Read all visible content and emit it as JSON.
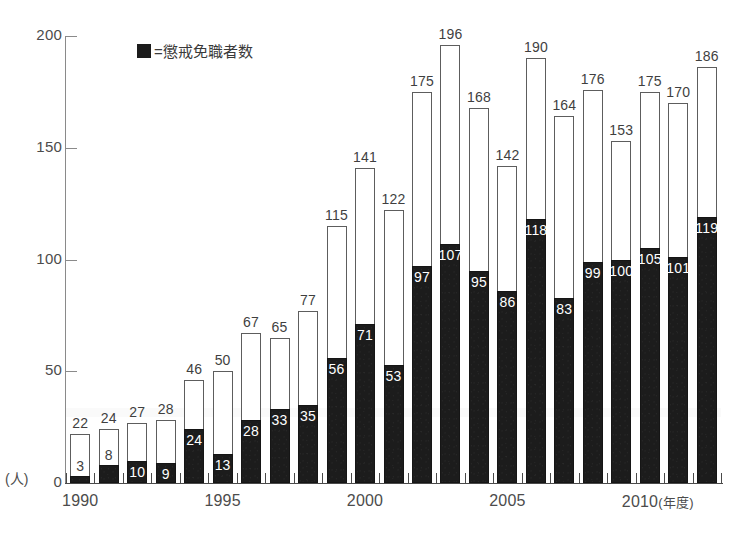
{
  "legend": {
    "swatch": "dark-square-icon",
    "text": "=懲戒免職者数",
    "swatch_color": "#1c1c1c"
  },
  "axes": {
    "y_unit": "(人)",
    "y_ticks": [
      "0",
      "50",
      "100",
      "150",
      "200"
    ],
    "x_unit": "(年度)",
    "x_ticks": [
      "1990",
      "1995",
      "2000",
      "2005",
      "2010"
    ]
  },
  "colors": {
    "total_bar_fill": "#ffffff",
    "total_bar_border": "#5d5d5d",
    "dark_bar_fill": "#1c1c1c",
    "text": "#3f3f3f",
    "axis": "#4a4a4a"
  },
  "chart_data": {
    "type": "bar",
    "title": "",
    "subtitle": "",
    "xlabel": "(年度)",
    "ylabel": "(人)",
    "ylim": [
      0,
      200
    ],
    "grid": false,
    "legend_position": "top-left",
    "stacked": true,
    "categories": [
      "1990",
      "1991",
      "1992",
      "1993",
      "1994",
      "1995",
      "1996",
      "1997",
      "1998",
      "1999",
      "2000",
      "2001",
      "2002",
      "2003",
      "2004",
      "2005",
      "2006",
      "2007",
      "2008",
      "2009",
      "2010",
      "2011",
      "2012"
    ],
    "series": [
      {
        "name": "総数",
        "values": [
          22,
          24,
          27,
          28,
          46,
          50,
          67,
          65,
          77,
          115,
          141,
          122,
          175,
          196,
          168,
          142,
          190,
          164,
          176,
          153,
          175,
          170,
          186
        ]
      },
      {
        "name": "懲戒免職者数",
        "values": [
          3,
          8,
          10,
          9,
          24,
          13,
          28,
          33,
          35,
          56,
          71,
          53,
          97,
          107,
          95,
          86,
          118,
          83,
          99,
          100,
          105,
          101,
          119
        ]
      }
    ],
    "tick_label_indices": [
      0,
      5,
      10,
      15,
      20
    ]
  }
}
